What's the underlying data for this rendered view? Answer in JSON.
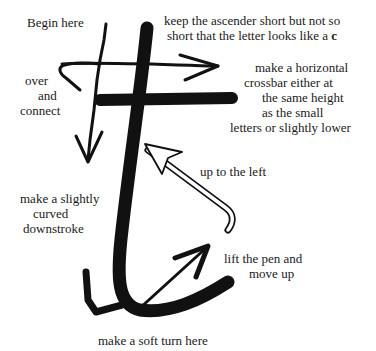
{
  "diagram": {
    "ink_color": "#111111",
    "background_color": "#ffffff",
    "labels": {
      "begin_here": "Begin here",
      "keep_ascender": {
        "line1": "keep the ascender short but not so",
        "line2_prefix": "short that the letter looks like a ",
        "line2_emphasis": "c"
      },
      "over_and_connect": [
        "over",
        "and",
        "connect"
      ],
      "crossbar": [
        "make a horizontal",
        "crossbar either at",
        "the same height",
        "as the small",
        "letters or slightly lower"
      ],
      "up_to_left": "up to the left",
      "curved_downstroke": [
        "make a slightly",
        "curved",
        "downstroke"
      ],
      "lift_pen": [
        "lift the pen and",
        "move up"
      ],
      "soft_turn": "make a soft turn here"
    },
    "strokes": [
      {
        "id": "ascender-downstroke",
        "description": "thick main stroke of the t"
      },
      {
        "id": "crossbar",
        "description": "thick horizontal crossbar"
      },
      {
        "id": "over-and-connect-arrow",
        "description": "thin arrow looping over and down"
      },
      {
        "id": "crossbar-direction-arrow",
        "description": "thin arrow pointing right"
      },
      {
        "id": "up-to-left-arrow",
        "description": "outlined arrow pointing up-left"
      },
      {
        "id": "lift-pen-arrow",
        "description": "thin arrow pointing up-right"
      }
    ]
  }
}
